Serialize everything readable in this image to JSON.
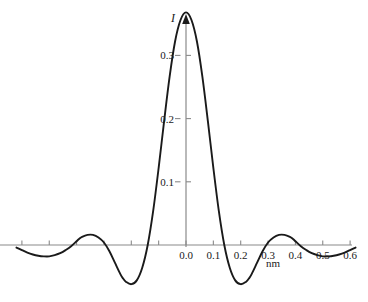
{
  "chart_data": {
    "type": "line",
    "title": "",
    "subtitle": "",
    "xlabel": "nm",
    "ylabel": "I",
    "xlim": [
      -0.62,
      0.63
    ],
    "ylim": [
      -0.105,
      0.4
    ],
    "grid": false,
    "legend": null,
    "x_ticks": [
      {
        "value": -0.6,
        "label": ""
      },
      {
        "value": -0.5,
        "label": ""
      },
      {
        "value": -0.4,
        "label": ""
      },
      {
        "value": -0.3,
        "label": ""
      },
      {
        "value": -0.2,
        "label": ""
      },
      {
        "value": -0.1,
        "label": ""
      },
      {
        "value": 0.0,
        "label": "0.0"
      },
      {
        "value": 0.1,
        "label": "0.1"
      },
      {
        "value": 0.2,
        "label": "0.2"
      },
      {
        "value": 0.3,
        "label": "0.3"
      },
      {
        "value": 0.4,
        "label": "0.4"
      },
      {
        "value": 0.5,
        "label": "0.5"
      },
      {
        "value": 0.6,
        "label": "0.6"
      }
    ],
    "y_ticks": [
      {
        "value": 0.1,
        "label": "0.1"
      },
      {
        "value": 0.2,
        "label": "0.2"
      },
      {
        "value": 0.3,
        "label": "0.3"
      }
    ],
    "series": [
      {
        "name": "I",
        "color": "#1a1a1a",
        "x": [
          -0.62,
          -0.6,
          -0.58,
          -0.56,
          -0.54,
          -0.52,
          -0.5,
          -0.48,
          -0.46,
          -0.44,
          -0.42,
          -0.4,
          -0.39,
          -0.38,
          -0.36,
          -0.34,
          -0.32,
          -0.3,
          -0.28,
          -0.26,
          -0.24,
          -0.23,
          -0.22,
          -0.2,
          -0.18,
          -0.16,
          -0.14,
          -0.12,
          -0.1,
          -0.08,
          -0.06,
          -0.04,
          -0.02,
          0.0,
          0.02,
          0.04,
          0.06,
          0.08,
          0.1,
          0.12,
          0.14,
          0.16,
          0.18,
          0.2,
          0.22,
          0.23,
          0.24,
          0.26,
          0.28,
          0.3,
          0.32,
          0.34,
          0.36,
          0.38,
          0.39,
          0.4,
          0.42,
          0.44,
          0.46,
          0.48,
          0.5,
          0.52,
          0.54,
          0.56,
          0.58,
          0.6,
          0.62
        ],
        "y": [
          -0.004,
          -0.008,
          -0.012,
          -0.015,
          -0.017,
          -0.018,
          -0.018,
          -0.016,
          -0.013,
          -0.008,
          -0.002,
          0.006,
          0.01,
          0.013,
          0.016,
          0.016,
          0.012,
          0.004,
          -0.01,
          -0.028,
          -0.046,
          -0.053,
          -0.058,
          -0.062,
          -0.056,
          -0.036,
          0.0,
          0.054,
          0.122,
          0.196,
          0.266,
          0.322,
          0.356,
          0.368,
          0.356,
          0.322,
          0.266,
          0.196,
          0.122,
          0.054,
          0.0,
          -0.036,
          -0.056,
          -0.062,
          -0.058,
          -0.053,
          -0.046,
          -0.028,
          -0.01,
          0.004,
          0.012,
          0.016,
          0.016,
          0.013,
          0.01,
          0.006,
          -0.002,
          -0.008,
          -0.013,
          -0.016,
          -0.018,
          -0.018,
          -0.017,
          -0.015,
          -0.012,
          -0.008,
          -0.004
        ],
        "peak": {
          "x": 0.0,
          "y": 0.37
        },
        "minima": [
          {
            "x": -0.23,
            "y": -0.062
          },
          {
            "x": 0.23,
            "y": -0.062
          }
        ],
        "side_maxima": [
          {
            "x": -0.39,
            "y": 0.016
          },
          {
            "x": 0.39,
            "y": 0.016
          }
        ]
      }
    ],
    "axis_style": {
      "axis_color": "#8a8a8a",
      "curve_color": "#1a1a1a",
      "tick_color": "#8a8a8a",
      "background": "#ffffff"
    }
  }
}
